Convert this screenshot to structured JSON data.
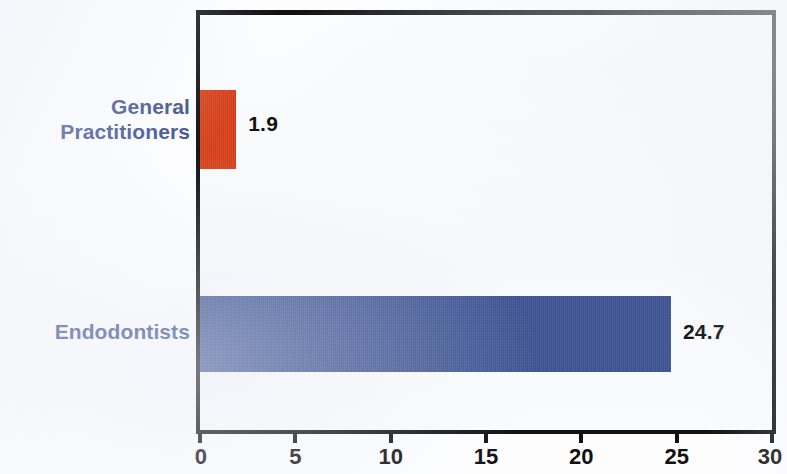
{
  "chart_data": {
    "type": "bar",
    "orientation": "horizontal",
    "title": "",
    "subtitle": "",
    "xlabel": "",
    "ylabel": "",
    "categories": [
      "General\nPractitioners",
      "Endodontists"
    ],
    "values": [
      1.9,
      24.7
    ],
    "value_labels": [
      "1.9",
      "24.7"
    ],
    "series": [
      {
        "name": "",
        "values": [
          1.9,
          24.7
        ]
      }
    ],
    "bar_colors": [
      "#d8401a",
      "#3d5496"
    ],
    "xlim": [
      0,
      30
    ],
    "xticks": [
      0,
      5,
      10,
      15,
      20,
      25,
      30
    ],
    "xtick_labels": [
      "0",
      "5",
      "10",
      "15",
      "20",
      "25",
      "30"
    ],
    "grid": false,
    "legend": null,
    "legend_position": "none",
    "annotations": [],
    "axis_color": "#111111",
    "category_label_color": "#3c4f8e",
    "value_label_color": "#121212",
    "plot_background": "#fafbfd",
    "frame": true
  }
}
